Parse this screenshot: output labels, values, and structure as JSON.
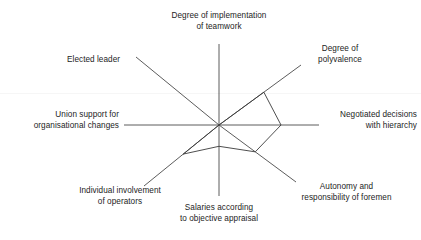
{
  "chart_data": {
    "type": "radar",
    "title": "",
    "subtitle": "",
    "xlabel": "",
    "ylabel": "",
    "grid": false,
    "legend": "none",
    "rmin": 0,
    "rmax": 1,
    "axis_count": 8,
    "categories": [
      "Degree of implementation of teamwork",
      "Degree of polyvalence",
      "Negotiated decisions with hierarchy",
      "Autonomy and responsibility of foremen",
      "Salaries according to objective appraisal",
      "Individual involvement of operators",
      "Union support for organisational changes",
      "Elected leader"
    ],
    "series": [
      {
        "name": "",
        "values": [
          0.0,
          0.55,
          0.62,
          0.47,
          0.3,
          0.48,
          0.0,
          0.0
        ]
      }
    ],
    "axis_labels": [
      {
        "id": "axis-teamwork",
        "position": "north",
        "angle_deg": 90,
        "lines": [
          "Degree of implementation",
          "of teamwork"
        ],
        "value": 0.0
      },
      {
        "id": "axis-polyvalence",
        "position": "north-east",
        "angle_deg": 45,
        "lines": [
          "Degree of",
          "polyvalence"
        ],
        "value": 0.55
      },
      {
        "id": "axis-negotiated-decisions",
        "position": "east",
        "angle_deg": 0,
        "lines": [
          "Negotiated decisions",
          "with hierarchy"
        ],
        "value": 0.62
      },
      {
        "id": "axis-autonomy-foremen",
        "position": "south-east",
        "angle_deg": -45,
        "lines": [
          "Autonomy and",
          "responsibility of foremen"
        ],
        "value": 0.47
      },
      {
        "id": "axis-salaries",
        "position": "south",
        "angle_deg": -90,
        "lines": [
          "Salaries according",
          "to objective appraisal"
        ],
        "value": 0.3
      },
      {
        "id": "axis-individual-involvement",
        "position": "south-west",
        "angle_deg": -135,
        "lines": [
          "Individual involvement",
          "of operators"
        ],
        "value": 0.48
      },
      {
        "id": "axis-union-support",
        "position": "west",
        "angle_deg": 180,
        "lines": [
          "Union support for",
          "organisational changes"
        ],
        "value": 0.0
      },
      {
        "id": "axis-elected-leader",
        "position": "north-west",
        "angle_deg": 135,
        "lines": [
          "Elected leader"
        ],
        "value": 0.0
      }
    ]
  },
  "labels": {
    "north_line1": "Degree of implementation",
    "north_line2": "of teamwork",
    "northeast_line1": "Degree of",
    "northeast_line2": "polyvalence",
    "east_line1": "Negotiated decisions",
    "east_line2": "with hierarchy",
    "southeast_line1": "Autonomy and",
    "southeast_line2": "responsibility of foremen",
    "south_line1": "Salaries according",
    "south_line2": "to objective appraisal",
    "southwest_line1": "Individual involvement",
    "southwest_line2": "of operators",
    "west_line1": "Union support for",
    "west_line2": "organisational changes",
    "northwest_line1": "Elected leader"
  },
  "colors": {
    "background": "#ffffff",
    "axis": "#4a4a4a",
    "data_outline": "#3a3a3a",
    "text": "#1d1d1d"
  }
}
